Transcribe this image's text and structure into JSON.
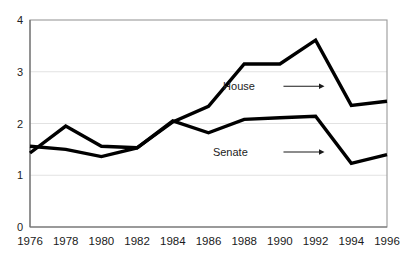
{
  "chart_data": {
    "type": "line",
    "title": "",
    "xlabel": "",
    "ylabel": "",
    "x": [
      1976,
      1978,
      1980,
      1982,
      1984,
      1986,
      1988,
      1990,
      1992,
      1994,
      1996
    ],
    "categories": [
      "1976",
      "1978",
      "1980",
      "1982",
      "1984",
      "1986",
      "1988",
      "1990",
      "1992",
      "1994",
      "1996"
    ],
    "xlim": [
      1976,
      1996
    ],
    "ylim": [
      0,
      4
    ],
    "yticks": [
      "0",
      "1",
      "2",
      "3",
      "4"
    ],
    "ytick_values": [
      0,
      1,
      2,
      3,
      4
    ],
    "grid": true,
    "grid_axis": "y",
    "legend": "inline-annotations",
    "series": [
      {
        "name": "House",
        "color": "#000000",
        "values": [
          1.43,
          1.95,
          1.56,
          1.53,
          2.03,
          2.33,
          3.15,
          3.15,
          3.61,
          2.35,
          2.43
        ]
      },
      {
        "name": "Senate",
        "color": "#000000",
        "values": [
          1.56,
          1.5,
          1.36,
          1.53,
          2.05,
          1.82,
          2.08,
          2.11,
          2.14,
          1.23,
          1.4
        ]
      }
    ],
    "annotations": [
      {
        "label": "House",
        "series": "House",
        "text_x": 1988.6,
        "text_y": 2.72,
        "arrow_from_x": 1990.2,
        "arrow_from_y": 2.72,
        "arrow_to_x": 1992.5,
        "arrow_to_y": 2.72
      },
      {
        "label": "Senate",
        "series": "Senate",
        "text_x": 1988.2,
        "text_y": 1.45,
        "arrow_from_x": 1990.2,
        "arrow_from_y": 1.45,
        "arrow_to_x": 1992.5,
        "arrow_to_y": 1.45
      }
    ]
  },
  "axes": {
    "y_tick_labels": [
      "4",
      "3",
      "2",
      "1",
      "0"
    ],
    "x_tick_labels": [
      "1976",
      "1978",
      "1980",
      "1982",
      "1984",
      "1986",
      "1988",
      "1990",
      "1992",
      "1994",
      "1996"
    ]
  },
  "colors": {
    "series": "#000000",
    "grid": "#e2e2e2",
    "frame": "#9a9a9a",
    "background": "#ffffff",
    "text": "#1a1a1a"
  }
}
